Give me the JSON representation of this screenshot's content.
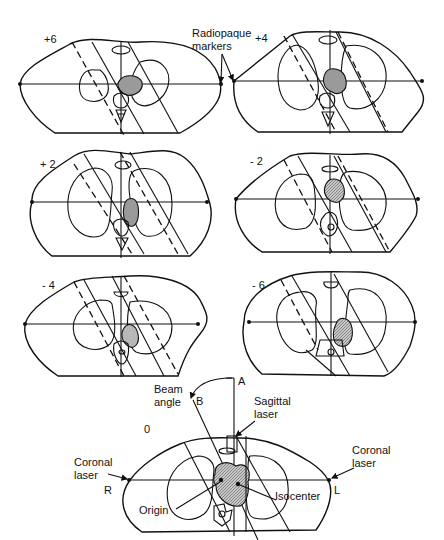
{
  "figure": {
    "panels": [
      {
        "id": "p6",
        "label": "+6"
      },
      {
        "id": "p4",
        "label": "+4"
      },
      {
        "id": "p2",
        "label": "+ 2"
      },
      {
        "id": "m2",
        "label": "- 2"
      },
      {
        "id": "m4",
        "label": "- 4"
      },
      {
        "id": "m6",
        "label": "- 6"
      },
      {
        "id": "p0",
        "label": "0"
      }
    ],
    "annotations": {
      "radiopaque_markers": [
        "Radiopaque",
        "markers"
      ],
      "beam_angle": [
        "Beam",
        "angle"
      ],
      "point_a": "A",
      "point_b": "B",
      "sagittal_laser": [
        "Sagittal",
        "laser"
      ],
      "coronal_laser_left": [
        "Coronal",
        "laser"
      ],
      "coronal_laser_right": [
        "Coronal",
        "laser"
      ],
      "side_r": "R",
      "side_l": "L",
      "origin": "Origin",
      "isocenter": "Isocenter"
    }
  }
}
